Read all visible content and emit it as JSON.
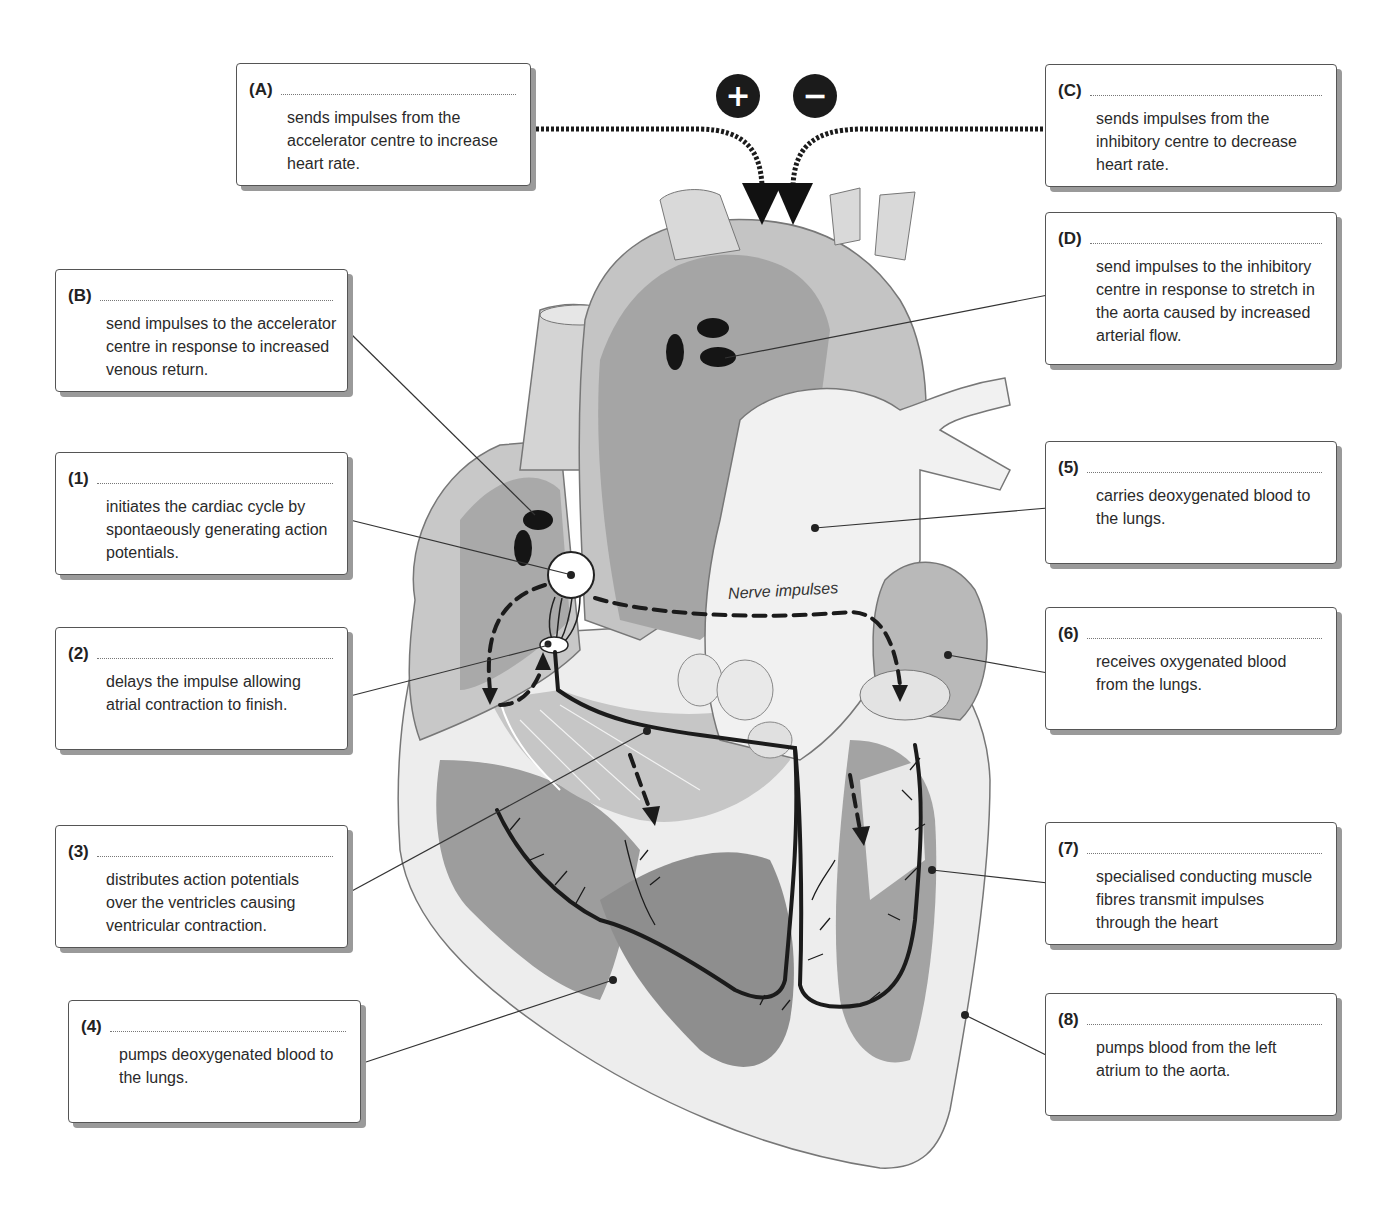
{
  "diagram": {
    "title_hint": "Control and conduction system of the heart",
    "nerve_label": "Nerve impulses",
    "signs": {
      "accelerator": "+",
      "inhibitory": "−"
    },
    "icons": [
      "plus-icon",
      "minus-icon",
      "arrow-down-icon",
      "dashed-arrow-icon"
    ]
  },
  "labels": [
    {
      "id": "A",
      "key": "(A)",
      "text": "sends impulses from the accelerator centre to increase heart rate."
    },
    {
      "id": "B",
      "key": "(B)",
      "text": "send impulses to the accelerator centre in response to increased venous return."
    },
    {
      "id": "C",
      "key": "(C)",
      "text": "sends impulses from the inhibitory centre to decrease heart rate."
    },
    {
      "id": "D",
      "key": "(D)",
      "text": "send impulses to the inhibitory centre in response to stretch in the aorta caused by increased arterial flow."
    },
    {
      "id": "1",
      "key": "(1)",
      "text": "initiates the cardiac cycle by spontaeously generating action potentials."
    },
    {
      "id": "2",
      "key": "(2)",
      "text": "delays the impulse allowing atrial contraction to finish."
    },
    {
      "id": "3",
      "key": "(3)",
      "text": "distributes action potentials over the ventricles causing ventricular contraction."
    },
    {
      "id": "4",
      "key": "(4)",
      "text": "pumps deoxygenated blood to the lungs."
    },
    {
      "id": "5",
      "key": "(5)",
      "text": "carries deoxygenated blood to the lungs."
    },
    {
      "id": "6",
      "key": "(6)",
      "text": "receives oxygenated blood from the lungs."
    },
    {
      "id": "7",
      "key": "(7)",
      "text": "specialised conducting muscle fibres transmit impulses through the heart"
    },
    {
      "id": "8",
      "key": "(8)",
      "text": "pumps blood from the left atrium to the aorta."
    }
  ],
  "colors": {
    "box_border": "#555555",
    "box_shadow": "#9a9a9a",
    "heart_light": "#d9d9d9",
    "heart_mid": "#b8b8b8",
    "heart_dark": "#8f8f8f",
    "ink": "#1b1b1b"
  }
}
